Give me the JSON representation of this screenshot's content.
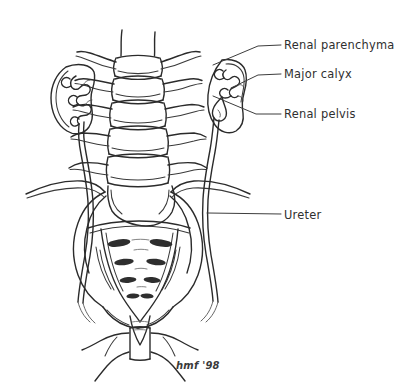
{
  "figure": {
    "background_color": "#ffffff",
    "ink_color": "#2b2b2b",
    "foramen_color": "#2e2e2e",
    "width": 402,
    "height": 389
  },
  "labels": [
    {
      "id": "renal-parenchyma",
      "text": "Renal parenchyma",
      "text_x": 284,
      "text_y": 49,
      "leader": "M 281 45 L 258 46 L 213 65",
      "target": "right-kidney-outer-cortex"
    },
    {
      "id": "major-calyx",
      "text": "Major calyx",
      "text_x": 284,
      "text_y": 78,
      "leader": "M 281 74 L 258 75 L 231 88",
      "target": "right-kidney-major-calyx"
    },
    {
      "id": "renal-pelvis",
      "text": "Renal pelvis",
      "text_x": 284,
      "text_y": 118,
      "leader": "M 281 114 L 256 114 L 213 96",
      "target": "right-kidney-renal-pelvis"
    },
    {
      "id": "ureter",
      "text": "Ureter",
      "text_x": 284,
      "text_y": 219,
      "leader": "M 281 214 L 207 213",
      "target": "right-ureter-mid-segment"
    }
  ],
  "signature": {
    "text": "hmf '98",
    "x": 176,
    "y": 369
  },
  "anatomy": {
    "structures": [
      "left kidney",
      "right kidney",
      "left ureter",
      "right ureter",
      "lumbar vertebrae",
      "transverse processes",
      "sacrum",
      "sacral foramina",
      "iliac wings",
      "iliac crests",
      "pubic symphysis",
      "inferior pubic rami",
      "coccyx"
    ],
    "vertebra_count": 5,
    "sacral_foramina_pairs": 4
  }
}
